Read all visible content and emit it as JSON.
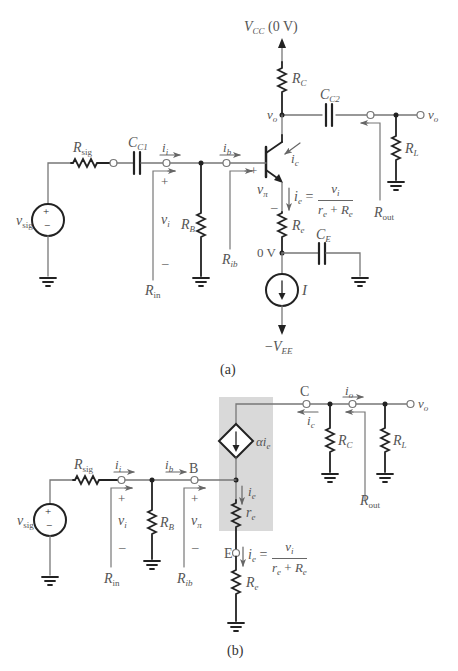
{
  "figure": {
    "part_a": {
      "caption": "(a)",
      "labels": {
        "vcc": "V",
        "vcc_sub": "CC",
        "vcc_val": " (0 V)",
        "rc": "R",
        "rc_sub": "C",
        "cc2": "C",
        "cc2_sub": "C2",
        "vo_node": "v",
        "vo_node_sub": "o",
        "vo_out": "v",
        "vo_out_sub": "o",
        "rl": "R",
        "rl_sub": "L",
        "rout": "R",
        "rout_sub": "out",
        "rsig": "R",
        "rsig_sub": "sig",
        "cc1": "C",
        "cc1_sub": "C1",
        "ii": "i",
        "ii_sub": "i",
        "ib": "i",
        "ib_sub": "b",
        "ic": "i",
        "ic_sub": "c",
        "vsig": "v",
        "vsig_sub": "sig",
        "plus_vi": "+",
        "vi": "v",
        "vi_sub": "i",
        "minus_vi": "–",
        "rb": "R",
        "rb_sub": "B",
        "rin": "R",
        "rin_sub": "in",
        "rib": "R",
        "rib_sub": "ib",
        "plus_vpi": "+",
        "vpi": "v",
        "vpi_sub": "π",
        "minus_vpi": "–",
        "ie": "i",
        "ie_sub": "e",
        "ie_eq": " =",
        "ie_num": "v",
        "ie_num_sub": "i",
        "ie_den_a": "r",
        "ie_den_a_sub": "e",
        "ie_den_plus": " + ",
        "ie_den_b": "R",
        "ie_den_b_sub": "e",
        "re": "R",
        "re_sub": "e",
        "ce": "C",
        "ce_sub": "E",
        "zero_v": "0 V",
        "i_src": "I",
        "vee_minus": "−",
        "vee": "V",
        "vee_sub": "EE",
        "source_plus": "+",
        "source_minus": "−"
      }
    },
    "part_b": {
      "caption": "(b)",
      "labels": {
        "rsig": "R",
        "rsig_sub": "sig",
        "ii": "i",
        "ii_sub": "i",
        "ib": "i",
        "ib_sub": "b",
        "node_b": "B",
        "node_c": "C",
        "node_e": "E",
        "io": "i",
        "io_sub": "o",
        "ic": "i",
        "ic_sub": "c",
        "vo_out": "v",
        "vo_out_sub": "o",
        "rc": "R",
        "rc_sub": "C",
        "rl": "R",
        "rl_sub": "L",
        "rout": "R",
        "rout_sub": "out",
        "dep_src_alpha": "α",
        "dep_src_i": "i",
        "dep_src_sub": "e",
        "vsig": "v",
        "vsig_sub": "sig",
        "plus_vi": "+",
        "vi": "v",
        "vi_sub": "i",
        "minus_vi": "–",
        "rb": "R",
        "rb_sub": "B",
        "plus_vpi": "+",
        "vpi": "v",
        "vpi_sub": "π",
        "minus_vpi": "–",
        "rin": "R",
        "rin_sub": "in",
        "rib": "R",
        "rib_sub": "ib",
        "ie_small": "i",
        "ie_small_sub": "e",
        "re_small": "r",
        "re_small_sub": "e",
        "ie": "i",
        "ie_sub": "e",
        "ie_eq": " =",
        "ie_num": "v",
        "ie_num_sub": "i",
        "ie_den_a": "r",
        "ie_den_a_sub": "e",
        "ie_den_plus": " + ",
        "ie_den_b": "R",
        "ie_den_b_sub": "e",
        "re": "R",
        "re_sub": "e",
        "source_plus": "+",
        "source_minus": "−"
      }
    },
    "colors": {
      "wire": "#777777",
      "component": "#222222",
      "label": "#555555",
      "shade": "#d9d9d9"
    }
  }
}
